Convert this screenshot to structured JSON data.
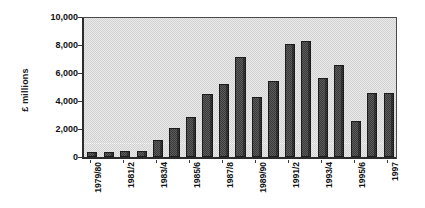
{
  "chart_data": {
    "type": "bar",
    "title": "",
    "subtitle": "",
    "xlabel": "",
    "ylabel": "£ millions",
    "ylim": [
      0,
      10000
    ],
    "ytick_labels": [
      "0",
      "2,000",
      "4,000",
      "6,000",
      "8,000",
      "10,000"
    ],
    "ytick_values": [
      0,
      2000,
      4000,
      6000,
      8000,
      10000
    ],
    "grid": true,
    "legend": "none",
    "bar_color": "#4b4b4b",
    "plot_background": "#dcdcdc",
    "categories": [
      "1979/80",
      "1980/1",
      "1981/2",
      "1982/3",
      "1983/4",
      "1984/5",
      "1985/6",
      "1986/7",
      "1987/8",
      "1988/9",
      "1989/90",
      "1990/1",
      "1991/2",
      "1992/3",
      "1993/4",
      "1994/5",
      "1995/6",
      "1996/7",
      "1997"
    ],
    "values": [
      350,
      380,
      420,
      400,
      1250,
      2100,
      2850,
      4500,
      5250,
      7150,
      4300,
      5450,
      8050,
      8300,
      5650,
      6550,
      2600,
      4600,
      4600
    ],
    "visible_xtick_labels": [
      "1979/80",
      "1981/2",
      "1983/4",
      "1985/6",
      "1987/8",
      "1989/90",
      "1991/2",
      "1993/4",
      "1995/6",
      "1997"
    ],
    "visible_xtick_indices": [
      0,
      2,
      4,
      6,
      8,
      10,
      12,
      14,
      16,
      18
    ]
  }
}
